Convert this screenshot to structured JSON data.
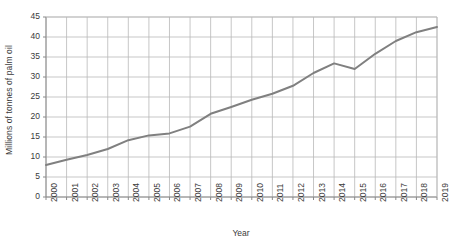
{
  "chart_data": {
    "type": "line",
    "title": "",
    "xlabel": "Year",
    "ylabel": "Millions of tonnes of palm oil",
    "x": [
      "2000",
      "2001",
      "2002",
      "2003",
      "2004",
      "2005",
      "2006",
      "2007",
      "2008",
      "2009",
      "2010",
      "2011",
      "2012",
      "2013",
      "2014",
      "2015",
      "2016",
      "2017",
      "2018",
      "2019"
    ],
    "categories": [
      "2000",
      "2001",
      "2002",
      "2003",
      "2004",
      "2005",
      "2006",
      "2007",
      "2008",
      "2009",
      "2010",
      "2011",
      "2012",
      "2013",
      "2014",
      "2015",
      "2016",
      "2017",
      "2018",
      "2019"
    ],
    "values": [
      8.0,
      9.3,
      10.5,
      12.0,
      14.2,
      15.4,
      15.9,
      17.6,
      20.8,
      22.5,
      24.3,
      25.8,
      27.8,
      31.0,
      33.4,
      32.0,
      35.8,
      39.0,
      41.2,
      42.5
    ],
    "series": [
      {
        "name": "Palm oil production",
        "values": [
          8.0,
          9.3,
          10.5,
          12.0,
          14.2,
          15.4,
          15.9,
          17.6,
          20.8,
          22.5,
          24.3,
          25.8,
          27.8,
          31.0,
          33.4,
          32.0,
          35.8,
          39.0,
          41.2,
          42.5
        ]
      }
    ],
    "yticks": [
      0,
      5,
      10,
      15,
      20,
      25,
      30,
      35,
      40,
      45
    ],
    "ytick_labels": [
      "0",
      "5",
      "10",
      "15",
      "20",
      "25",
      "30",
      "35",
      "40",
      "45"
    ],
    "ylim": [
      0,
      45
    ],
    "xlim": [
      "2000",
      "2019"
    ],
    "grid": true,
    "legend": false,
    "legend_position": "none",
    "line_color": "#808080",
    "grid_color": "#b9b9b9",
    "axis_color": "#8a8a8a",
    "text_color": "#3a3a3a",
    "background": "#ffffff"
  }
}
